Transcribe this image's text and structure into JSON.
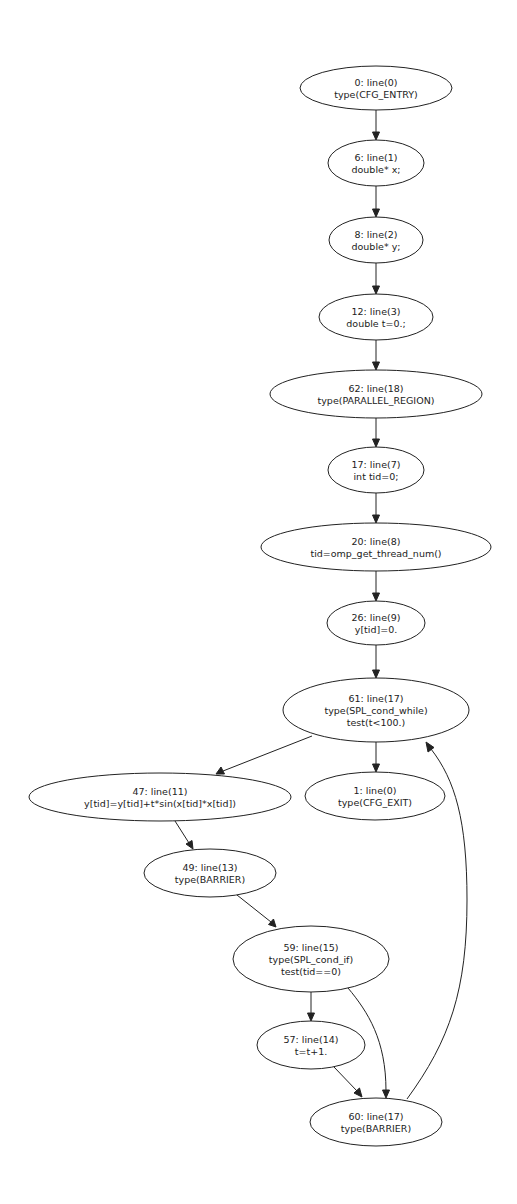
{
  "graph": {
    "type": "control-flow-graph",
    "nodes": [
      {
        "id": "0",
        "lines": [
          "0: line(0)",
          "type(CFG_ENTRY)"
        ],
        "cx": 376,
        "cy": 88,
        "rx": 76,
        "ry": 22
      },
      {
        "id": "6",
        "lines": [
          "6: line(1)",
          "double* x;"
        ],
        "cx": 376,
        "cy": 163,
        "rx": 48,
        "ry": 23
      },
      {
        "id": "8",
        "lines": [
          "8: line(2)",
          "double* y;"
        ],
        "cx": 376,
        "cy": 240,
        "rx": 47,
        "ry": 23
      },
      {
        "id": "12",
        "lines": [
          "12: line(3)",
          "double t=0.;"
        ],
        "cx": 376,
        "cy": 317,
        "rx": 57,
        "ry": 23
      },
      {
        "id": "62",
        "lines": [
          "62: line(18)",
          "type(PARALLEL_REGION)"
        ],
        "cx": 376,
        "cy": 394,
        "rx": 106,
        "ry": 24
      },
      {
        "id": "17",
        "lines": [
          "17: line(7)",
          "int tid=0;"
        ],
        "cx": 376,
        "cy": 470,
        "rx": 48,
        "ry": 23
      },
      {
        "id": "20",
        "lines": [
          "20: line(8)",
          "tid=omp_get_thread_num()"
        ],
        "cx": 376,
        "cy": 547,
        "rx": 115,
        "ry": 24
      },
      {
        "id": "26",
        "lines": [
          "26: line(9)",
          "y[tid]=0."
        ],
        "cx": 376,
        "cy": 623,
        "rx": 49,
        "ry": 22
      },
      {
        "id": "61",
        "lines": [
          "61: line(17)",
          "type(SPL_cond_while)",
          "test(t<100.)"
        ],
        "cx": 376,
        "cy": 710,
        "rx": 93,
        "ry": 32
      },
      {
        "id": "47",
        "lines": [
          "47: line(11)",
          "y[tid]=y[tid]+t*sin(x[tid]*x[tid])"
        ],
        "cx": 160,
        "cy": 797,
        "rx": 131,
        "ry": 24
      },
      {
        "id": "1",
        "lines": [
          "1: line(0)",
          "type(CFG_EXIT)"
        ],
        "cx": 375,
        "cy": 796,
        "rx": 70,
        "ry": 24
      },
      {
        "id": "49",
        "lines": [
          "49: line(13)",
          "type(BARRIER)"
        ],
        "cx": 210,
        "cy": 873,
        "rx": 66,
        "ry": 24
      },
      {
        "id": "59",
        "lines": [
          "59: line(15)",
          "type(SPL_cond_if)",
          "test(tid==0)"
        ],
        "cx": 311,
        "cy": 959,
        "rx": 78,
        "ry": 33
      },
      {
        "id": "57",
        "lines": [
          "57: line(14)",
          "t=t+1."
        ],
        "cx": 311,
        "cy": 1045,
        "rx": 54,
        "ry": 24
      },
      {
        "id": "60",
        "lines": [
          "60: line(17)",
          "type(BARRIER)"
        ],
        "cx": 376,
        "cy": 1122,
        "rx": 66,
        "ry": 24
      }
    ],
    "edges": [
      {
        "from": "0",
        "to": "6",
        "path": "M376,110 L376,133",
        "arrow": "372.5,132 379.5,132 376,140"
      },
      {
        "from": "6",
        "to": "8",
        "path": "M376,186 L376,210",
        "arrow": "372.5,209 379.5,209 376,217"
      },
      {
        "from": "8",
        "to": "12",
        "path": "M376,263 L376,287",
        "arrow": "372.5,286 379.5,286 376,294"
      },
      {
        "from": "12",
        "to": "62",
        "path": "M376,340 L376,363",
        "arrow": "372.5,362 379.5,362 376,370"
      },
      {
        "from": "62",
        "to": "17",
        "path": "M376,418 L376,440",
        "arrow": "372.5,439 379.5,439 376,447"
      },
      {
        "from": "17",
        "to": "20",
        "path": "M376,493 L376,516",
        "arrow": "372.5,515 379.5,515 376,523"
      },
      {
        "from": "20",
        "to": "26",
        "path": "M376,571 L376,594",
        "arrow": "372.5,593 379.5,593 376,601"
      },
      {
        "from": "26",
        "to": "61",
        "path": "M376,645 L376,671",
        "arrow": "372.5,670 379.5,670 376,678"
      },
      {
        "from": "61",
        "to": "47",
        "path": "M312,736 L223,771",
        "arrow": "221,767 224.5,774 216,774"
      },
      {
        "from": "61",
        "to": "1",
        "path": "M376,742 L376,765",
        "arrow": "372.5,764 379.5,764 376,772"
      },
      {
        "from": "47",
        "to": "49",
        "path": "M175,821 L189,843",
        "arrow": "186,844 192,840.5 193,849"
      },
      {
        "from": "49",
        "to": "59",
        "path": "M237,895 L271,922",
        "arrow": "268.5,924.5 273.5,919 276,927"
      },
      {
        "from": "59",
        "to": "57",
        "path": "M311,992 L311,1014",
        "arrow": "307.5,1013 314.5,1013 311,1021"
      },
      {
        "from": "59",
        "to": "60",
        "path": "M348,988 C368,1012 386,1040 386,1091",
        "arrow": "382.5,1090 389.5,1090 386,1098"
      },
      {
        "from": "57",
        "to": "60",
        "path": "M334,1067 L357,1091",
        "arrow": "354,1093 359.5,1088 362,1097"
      },
      {
        "from": "60",
        "to": "61",
        "path": "M407,1099 C450,1040 467,990 467,900 C467,820 455,780 431,749",
        "arrow": "428,752 434,747.5 426,742"
      }
    ]
  }
}
